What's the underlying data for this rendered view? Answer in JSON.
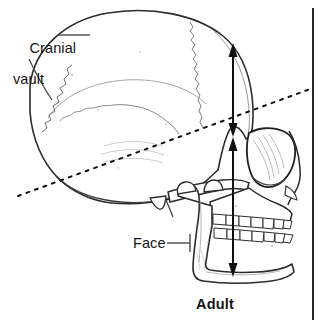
{
  "figure": {
    "title_text": "Adult",
    "background_color": "#ffffff",
    "ink_color": "#151515"
  },
  "labels": {
    "cranial_vault": {
      "line1": "Cranial",
      "line2": "vault"
    },
    "face": "Face",
    "adult": "Adult"
  },
  "annotations": {
    "cranial_vault_measure": {
      "name": "cranial vault height double arrow",
      "orientation": "vertical",
      "double_headed": true
    },
    "face_measure": {
      "name": "face height double arrow",
      "orientation": "vertical",
      "double_headed": true
    },
    "reference_line_dotted": {
      "name": "dotted diagonal reference line",
      "style": "dotted"
    },
    "reference_line_vertical": {
      "name": "vertical reference line at right margin",
      "style": "solid"
    }
  }
}
